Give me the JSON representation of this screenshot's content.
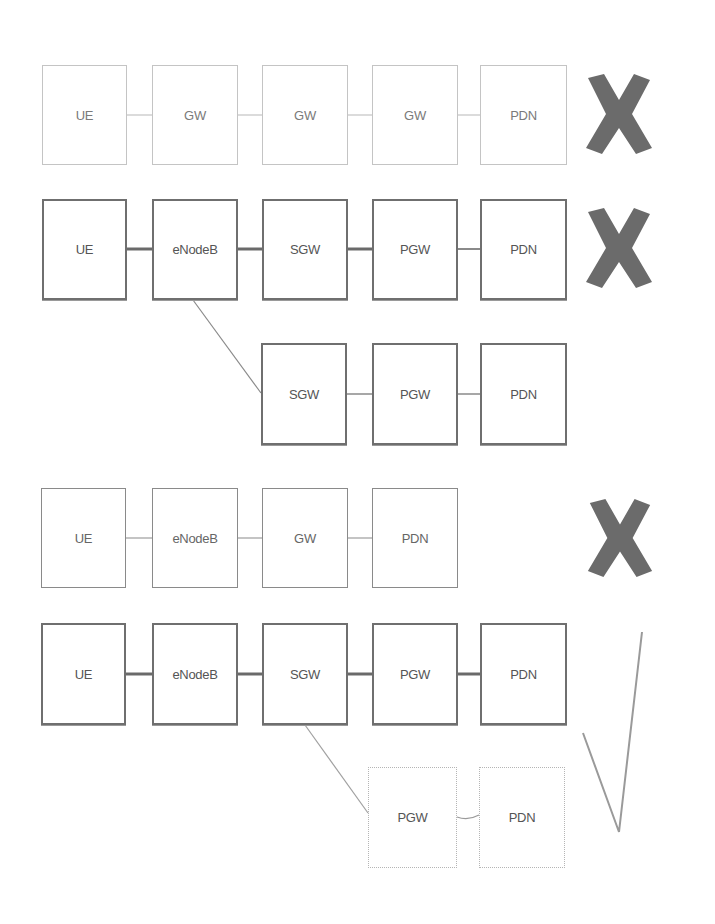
{
  "diagram": {
    "title": "",
    "rows": [
      {
        "id": "row1",
        "style": "faint",
        "verdict": "cross",
        "nodes": [
          "UE",
          "GW",
          "GW",
          "GW",
          "PDN"
        ]
      },
      {
        "id": "row2",
        "style": "strong",
        "verdict": "cross",
        "nodes": [
          "UE",
          "eNodeB",
          "SGW",
          "PGW",
          "PDN"
        ]
      },
      {
        "id": "row3",
        "style": "strong",
        "branch_from": "row2.eNodeB",
        "nodes": [
          "SGW",
          "PGW",
          "PDN"
        ]
      },
      {
        "id": "row4",
        "style": "medium",
        "verdict": "cross",
        "nodes": [
          "UE",
          "eNodeB",
          "GW",
          "PDN"
        ]
      },
      {
        "id": "row5",
        "style": "strong",
        "verdict": "check",
        "nodes": [
          "UE",
          "eNodeB",
          "SGW",
          "PGW",
          "PDN"
        ]
      },
      {
        "id": "row6",
        "style": "dashed",
        "branch_from": "row5.SGW",
        "nodes": [
          "PGW",
          "PDN"
        ]
      }
    ],
    "colors": {
      "cross_fill": "#6b6b6b",
      "check_stroke": "#9a9a9a",
      "strong_border": "#6f6f6f",
      "faint_border": "#c4c4c4"
    }
  }
}
